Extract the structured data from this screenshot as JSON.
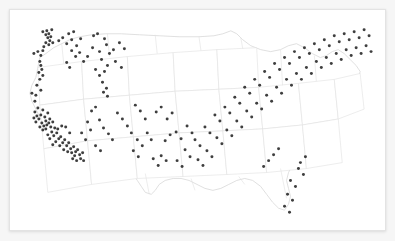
{
  "card": {
    "background_color": "#ffffff",
    "border_color": "#e3e3e3"
  },
  "page": {
    "background_color": "#f6f6f6"
  },
  "chart_data": {
    "type": "scatter",
    "title": "",
    "subtitle": "",
    "xlabel": "",
    "ylabel": "",
    "legend": [],
    "grid": false,
    "projection": "albers-usa",
    "basemap": {
      "name": "united-states-lower-48",
      "state_border_color": "#e0e0e0",
      "nation_border_color": "#d8d8d8",
      "land_fill": "#ffffff"
    },
    "marker": {
      "shape": "circle",
      "color": "#232323",
      "radius_px": 1.5,
      "opacity": 0.88
    },
    "xlim": [
      0,
      377
    ],
    "ylim": [
      0,
      222
    ],
    "point_count": 232,
    "points": [
      [
        33,
        22
      ],
      [
        36,
        25
      ],
      [
        37,
        21
      ],
      [
        38,
        28
      ],
      [
        39,
        24
      ],
      [
        40,
        31
      ],
      [
        41,
        27
      ],
      [
        36,
        33
      ],
      [
        39,
        35
      ],
      [
        34,
        37
      ],
      [
        42,
        20
      ],
      [
        43,
        33
      ],
      [
        24,
        44
      ],
      [
        28,
        42
      ],
      [
        31,
        46
      ],
      [
        33,
        41
      ],
      [
        30,
        52
      ],
      [
        31,
        56
      ],
      [
        32,
        60
      ],
      [
        29,
        63
      ],
      [
        33,
        66
      ],
      [
        30,
        70
      ],
      [
        27,
        76
      ],
      [
        31,
        81
      ],
      [
        26,
        86
      ],
      [
        22,
        84
      ],
      [
        25,
        92
      ],
      [
        49,
        31
      ],
      [
        53,
        28
      ],
      [
        57,
        34
      ],
      [
        62,
        30
      ],
      [
        67,
        36
      ],
      [
        59,
        24
      ],
      [
        64,
        22
      ],
      [
        71,
        29
      ],
      [
        62,
        41
      ],
      [
        66,
        47
      ],
      [
        70,
        43
      ],
      [
        57,
        53
      ],
      [
        60,
        58
      ],
      [
        74,
        52
      ],
      [
        78,
        47
      ],
      [
        84,
        26
      ],
      [
        88,
        24
      ],
      [
        95,
        29
      ],
      [
        83,
        38
      ],
      [
        90,
        42
      ],
      [
        97,
        35
      ],
      [
        92,
        50
      ],
      [
        98,
        56
      ],
      [
        95,
        62
      ],
      [
        86,
        60
      ],
      [
        90,
        66
      ],
      [
        93,
        73
      ],
      [
        97,
        79
      ],
      [
        94,
        83
      ],
      [
        98,
        87
      ],
      [
        100,
        44
      ],
      [
        104,
        40
      ],
      [
        110,
        33
      ],
      [
        115,
        39
      ],
      [
        106,
        52
      ],
      [
        112,
        58
      ],
      [
        25,
        103
      ],
      [
        28,
        99
      ],
      [
        31,
        106
      ],
      [
        33,
        101
      ],
      [
        35,
        108
      ],
      [
        38,
        104
      ],
      [
        36,
        112
      ],
      [
        40,
        110
      ],
      [
        29,
        110
      ],
      [
        32,
        114
      ],
      [
        34,
        117
      ],
      [
        37,
        116
      ],
      [
        30,
        118
      ],
      [
        33,
        121
      ],
      [
        36,
        120
      ],
      [
        39,
        114
      ],
      [
        41,
        118
      ],
      [
        43,
        113
      ],
      [
        27,
        107
      ],
      [
        26,
        113
      ],
      [
        24,
        109
      ],
      [
        42,
        123
      ],
      [
        45,
        119
      ],
      [
        44,
        127
      ],
      [
        47,
        124
      ],
      [
        49,
        130
      ],
      [
        46,
        133
      ],
      [
        51,
        128
      ],
      [
        53,
        134
      ],
      [
        50,
        137
      ],
      [
        55,
        131
      ],
      [
        57,
        137
      ],
      [
        54,
        141
      ],
      [
        59,
        134
      ],
      [
        61,
        140
      ],
      [
        58,
        143
      ],
      [
        62,
        144
      ],
      [
        64,
        138
      ],
      [
        66,
        143
      ],
      [
        65,
        147
      ],
      [
        68,
        141
      ],
      [
        70,
        146
      ],
      [
        63,
        150
      ],
      [
        67,
        152
      ],
      [
        71,
        150
      ],
      [
        73,
        144
      ],
      [
        74,
        152
      ],
      [
        48,
        120
      ],
      [
        52,
        117
      ],
      [
        40,
        130
      ],
      [
        43,
        136
      ],
      [
        38,
        126
      ],
      [
        56,
        118
      ],
      [
        60,
        124
      ],
      [
        72,
        124
      ],
      [
        76,
        131
      ],
      [
        82,
        102
      ],
      [
        86,
        98
      ],
      [
        90,
        111
      ],
      [
        94,
        119
      ],
      [
        99,
        125
      ],
      [
        103,
        131
      ],
      [
        86,
        137
      ],
      [
        91,
        142
      ],
      [
        78,
        113
      ],
      [
        81,
        121
      ],
      [
        108,
        104
      ],
      [
        113,
        110
      ],
      [
        118,
        117
      ],
      [
        122,
        124
      ],
      [
        126,
        96
      ],
      [
        131,
        102
      ],
      [
        136,
        110
      ],
      [
        128,
        131
      ],
      [
        133,
        137
      ],
      [
        124,
        142
      ],
      [
        129,
        148
      ],
      [
        138,
        124
      ],
      [
        142,
        131
      ],
      [
        147,
        103
      ],
      [
        152,
        98
      ],
      [
        158,
        110
      ],
      [
        163,
        104
      ],
      [
        156,
        132
      ],
      [
        161,
        126
      ],
      [
        152,
        147
      ],
      [
        157,
        152
      ],
      [
        144,
        150
      ],
      [
        149,
        157
      ],
      [
        167,
        123
      ],
      [
        172,
        130
      ],
      [
        178,
        117
      ],
      [
        183,
        124
      ],
      [
        176,
        141
      ],
      [
        181,
        148
      ],
      [
        168,
        152
      ],
      [
        173,
        158
      ],
      [
        186,
        131
      ],
      [
        191,
        137
      ],
      [
        196,
        118
      ],
      [
        201,
        124
      ],
      [
        189,
        151
      ],
      [
        194,
        157
      ],
      [
        198,
        142
      ],
      [
        203,
        148
      ],
      [
        206,
        106
      ],
      [
        211,
        112
      ],
      [
        208,
        129
      ],
      [
        213,
        135
      ],
      [
        216,
        98
      ],
      [
        221,
        104
      ],
      [
        218,
        121
      ],
      [
        223,
        127
      ],
      [
        226,
        88
      ],
      [
        231,
        94
      ],
      [
        228,
        112
      ],
      [
        233,
        118
      ],
      [
        236,
        78
      ],
      [
        241,
        84
      ],
      [
        238,
        102
      ],
      [
        243,
        108
      ],
      [
        246,
        70
      ],
      [
        251,
        76
      ],
      [
        248,
        94
      ],
      [
        253,
        100
      ],
      [
        256,
        62
      ],
      [
        261,
        68
      ],
      [
        258,
        86
      ],
      [
        263,
        92
      ],
      [
        266,
        54
      ],
      [
        271,
        60
      ],
      [
        268,
        78
      ],
      [
        273,
        84
      ],
      [
        276,
        48
      ],
      [
        281,
        54
      ],
      [
        278,
        70
      ],
      [
        283,
        76
      ],
      [
        286,
        42
      ],
      [
        291,
        48
      ],
      [
        288,
        64
      ],
      [
        293,
        70
      ],
      [
        296,
        38
      ],
      [
        301,
        44
      ],
      [
        298,
        58
      ],
      [
        303,
        64
      ],
      [
        306,
        34
      ],
      [
        311,
        40
      ],
      [
        308,
        52
      ],
      [
        313,
        58
      ],
      [
        316,
        30
      ],
      [
        321,
        36
      ],
      [
        318,
        48
      ],
      [
        323,
        54
      ],
      [
        326,
        26
      ],
      [
        331,
        32
      ],
      [
        328,
        44
      ],
      [
        333,
        50
      ],
      [
        336,
        24
      ],
      [
        341,
        30
      ],
      [
        338,
        40
      ],
      [
        343,
        46
      ],
      [
        346,
        22
      ],
      [
        351,
        28
      ],
      [
        348,
        38
      ],
      [
        353,
        44
      ],
      [
        356,
        20
      ],
      [
        361,
        26
      ],
      [
        358,
        36
      ],
      [
        363,
        42
      ],
      [
        290,
        160
      ],
      [
        295,
        166
      ],
      [
        282,
        172
      ],
      [
        287,
        178
      ],
      [
        279,
        186
      ],
      [
        284,
        192
      ],
      [
        276,
        198
      ],
      [
        281,
        204
      ],
      [
        292,
        154
      ],
      [
        297,
        148
      ],
      [
        270,
        140
      ],
      [
        265,
        146
      ],
      [
        260,
        152
      ],
      [
        255,
        158
      ]
    ]
  }
}
